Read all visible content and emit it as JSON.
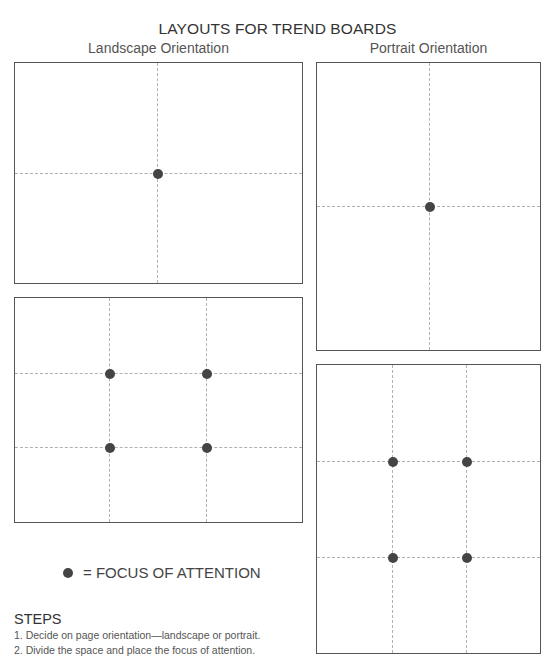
{
  "title": "LAYOUTS FOR TREND BOARDS",
  "columns": {
    "landscape": "Landscape Orientation",
    "portrait": "Portrait Orientation"
  },
  "boards": [
    {
      "name": "landscape-single-focus",
      "orientation": "landscape",
      "divisions": "halves",
      "focus_points": 1
    },
    {
      "name": "portrait-single-focus",
      "orientation": "portrait",
      "divisions": "halves",
      "focus_points": 1
    },
    {
      "name": "landscape-rule-of-thirds",
      "orientation": "landscape",
      "divisions": "thirds",
      "focus_points": 4
    },
    {
      "name": "portrait-rule-of-thirds",
      "orientation": "portrait",
      "divisions": "thirds",
      "focus_points": 4
    }
  ],
  "legend": {
    "symbol": "dot",
    "label": "= FOCUS OF ATTENTION"
  },
  "steps": {
    "heading": "STEPS",
    "items": [
      "1. Decide on page orientation—landscape or portrait.",
      "2. Divide the space and place the focus of attention."
    ]
  },
  "colors": {
    "border": "#555555",
    "grid_line": "#b0b0b0",
    "focus_dot": "#444444"
  }
}
